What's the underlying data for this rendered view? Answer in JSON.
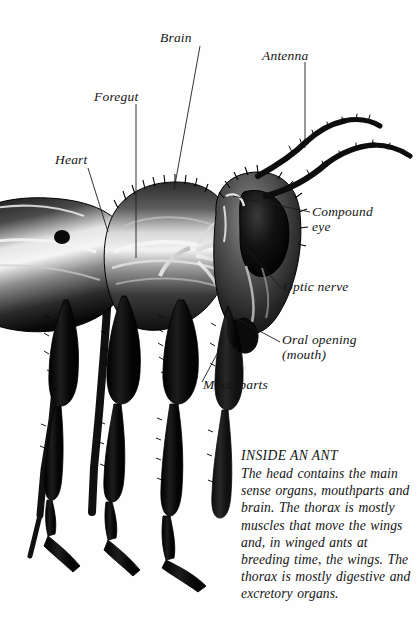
{
  "figure": {
    "subject": "ant",
    "style": "black and white airbrush scientific illustration"
  },
  "labels": [
    {
      "id": "heart",
      "text": "Heart",
      "x": 55,
      "y": 154
    },
    {
      "id": "foregut",
      "text": "Foregut",
      "x": 94,
      "y": 91
    },
    {
      "id": "brain",
      "text": "Brain",
      "x": 160,
      "y": 32
    },
    {
      "id": "antenna",
      "text": "Antenna",
      "x": 262,
      "y": 50
    },
    {
      "id": "compound-eye",
      "text": "Compound",
      "x": 312,
      "y": 206,
      "text2": "eye"
    },
    {
      "id": "optic-nerve",
      "text": "Optic nerve",
      "x": 283,
      "y": 281
    },
    {
      "id": "oral-opening",
      "text": "Oral opening",
      "x": 282,
      "y": 334,
      "text2": "(mouth)"
    },
    {
      "id": "mouthparts",
      "text": "Mouthparts",
      "x": 203,
      "y": 379
    }
  ],
  "caption": {
    "title": "INSIDE AN ANT",
    "body": "The head contains the main sense organs, mouthparts and brain. The thorax is mostly muscles that move the wings and, in winged ants at breeding time, the wings. The thorax is mostly digestive and excretory organs."
  },
  "colors": {
    "background": "#fefefe",
    "ink": "#141414",
    "leader_line": "#2a2a2a"
  }
}
